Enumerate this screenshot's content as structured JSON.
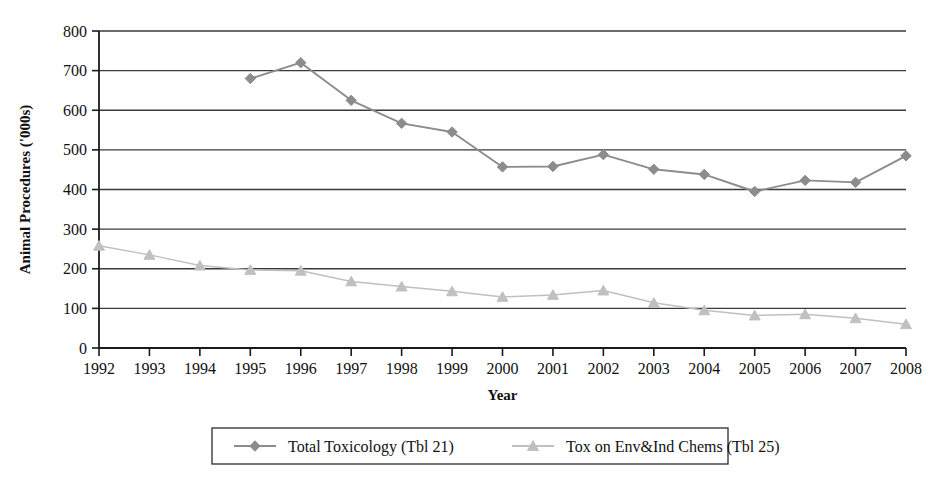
{
  "chart_data": {
    "type": "line",
    "title": "",
    "xlabel": "Year",
    "ylabel": "Animal Procedures ('000s)",
    "x": [
      1992,
      1993,
      1994,
      1995,
      1996,
      1997,
      1998,
      1999,
      2000,
      2001,
      2002,
      2003,
      2004,
      2005,
      2006,
      2007,
      2008
    ],
    "categories": [
      "1992",
      "1993",
      "1994",
      "1995",
      "1996",
      "1997",
      "1998",
      "1999",
      "2000",
      "2001",
      "2002",
      "2003",
      "2004",
      "2005",
      "2006",
      "2007",
      "2008"
    ],
    "xlim": [
      1992,
      2008
    ],
    "ylim": [
      0,
      800
    ],
    "yticks": [
      0,
      100,
      200,
      300,
      400,
      500,
      600,
      700,
      800
    ],
    "ytick_labels": [
      "0",
      "100",
      "200",
      "300",
      "400",
      "500",
      "600",
      "700",
      "800"
    ],
    "grid": "horizontal",
    "legend_position": "bottom",
    "series": [
      {
        "name": "Total Toxicology (Tbl 21)",
        "marker": "diamond",
        "color": "#8c8c8c",
        "values": [
          null,
          null,
          null,
          680,
          720,
          625,
          567,
          545,
          457,
          458,
          488,
          451,
          438,
          395,
          423,
          418,
          485
        ]
      },
      {
        "name": "Tox on Env&Ind Chems (Tbl 25)",
        "marker": "triangle",
        "color": "#c0c0c0",
        "values": [
          258,
          235,
          208,
          197,
          195,
          168,
          155,
          143,
          129,
          134,
          145,
          114,
          95,
          82,
          85,
          75,
          60
        ]
      }
    ]
  },
  "axes": {
    "y_title": "Animal Procedures ('000s)",
    "x_title": "Year"
  },
  "legend": {
    "entries": [
      {
        "label": "Total Toxicology (Tbl 21)",
        "marker": "diamond-marker-icon"
      },
      {
        "label": "Tox on Env&Ind Chems (Tbl 25)",
        "marker": "triangle-marker-icon"
      }
    ]
  },
  "colors": {
    "series1": "#8c8c8c",
    "series2": "#c0c0c0",
    "axis": "#1a1a1a",
    "grid": "#3a3a3a",
    "background": "#ffffff"
  }
}
